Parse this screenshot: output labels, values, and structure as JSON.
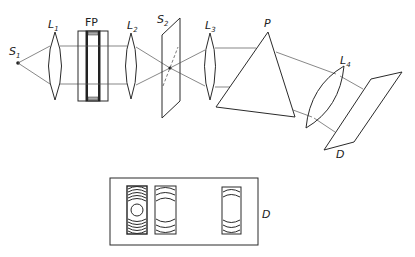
{
  "diagram": {
    "components": [
      {
        "id": "S1",
        "label": "S",
        "sub": "1",
        "role": "source"
      },
      {
        "id": "L1",
        "label": "L",
        "sub": "1",
        "role": "lens"
      },
      {
        "id": "FP",
        "label": "FP",
        "role": "fabry-perot-etalon"
      },
      {
        "id": "L2",
        "label": "L",
        "sub": "2",
        "role": "lens"
      },
      {
        "id": "S2",
        "label": "S",
        "sub": "2",
        "role": "slit"
      },
      {
        "id": "L3",
        "label": "L",
        "sub": "3",
        "role": "lens"
      },
      {
        "id": "P",
        "label": "P",
        "role": "prism"
      },
      {
        "id": "L4",
        "label": "L",
        "sub": "4",
        "role": "lens"
      },
      {
        "id": "D",
        "label": "D",
        "role": "detector-plane"
      }
    ],
    "inset": {
      "label": "D",
      "fringe_panels": 3
    },
    "colors": {
      "line": "#2a2a2a",
      "ray": "#555555",
      "background": "#ffffff"
    }
  }
}
